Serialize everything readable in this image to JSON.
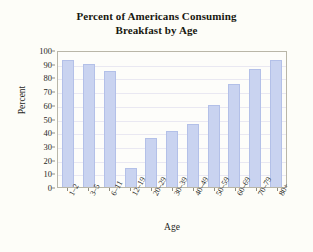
{
  "chart_data": {
    "type": "bar",
    "title": "Percent of Americans Consuming Breakfast by Age",
    "title_lines": [
      "Percent of Americans Consuming",
      "Breakfast by Age"
    ],
    "xlabel": "Age",
    "ylabel": "Percent",
    "categories": [
      "1–2",
      "3–5",
      "6–11",
      "12–19",
      "20–29",
      "30–39",
      "40–49",
      "50–59",
      "60–69",
      "70–79",
      "80+"
    ],
    "values": [
      93,
      90,
      85,
      14,
      36,
      41,
      46,
      60,
      75,
      86,
      93
    ],
    "ylim": [
      0,
      100
    ],
    "ytick_labels": [
      "100",
      "90",
      "80",
      "70",
      "60",
      "50",
      "40",
      "30",
      "20",
      "10",
      "0"
    ],
    "ytick_values": [
      100,
      90,
      80,
      70,
      60,
      50,
      40,
      30,
      20,
      10,
      0
    ],
    "grid": true,
    "legend": false,
    "colors": {
      "bar_fill": "#c9d3f0",
      "bar_border": "#b3c0e8",
      "plot_border": "#b9b6a8",
      "gridline": "#e9e8f2",
      "background": "#fdfdf8",
      "text": "#26261c"
    }
  }
}
